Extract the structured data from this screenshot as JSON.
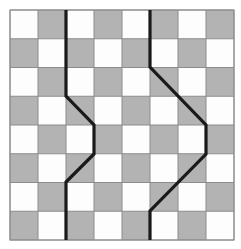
{
  "figure": {
    "colors": {
      "background": "#ffffff",
      "light_cell": "#fdfdfd",
      "dark_cell": "#b3b3b3",
      "cell_border": "#8c8c8c",
      "path_stroke": "#1a1a1a",
      "outer_border": "#8c8c8c"
    }
  },
  "grid": {
    "columns": 8,
    "rows": 8,
    "origin_x": 10,
    "origin_y": 10,
    "cell_width": 28,
    "cell_height": 28.75,
    "border_width": 1,
    "parity_note": "cell is dark when (row + col) is odd, with row 1 col 1 light",
    "cells": [
      [
        "light",
        "dark",
        "light",
        "dark",
        "light",
        "dark",
        "light",
        "dark"
      ],
      [
        "dark",
        "light",
        "dark",
        "light",
        "dark",
        "light",
        "dark",
        "light"
      ],
      [
        "light",
        "dark",
        "light",
        "dark",
        "light",
        "dark",
        "light",
        "dark"
      ],
      [
        "dark",
        "light",
        "dark",
        "light",
        "dark",
        "light",
        "dark",
        "light"
      ],
      [
        "light",
        "dark",
        "light",
        "dark",
        "light",
        "dark",
        "light",
        "dark"
      ],
      [
        "dark",
        "light",
        "dark",
        "light",
        "dark",
        "light",
        "dark",
        "light"
      ],
      [
        "light",
        "dark",
        "light",
        "dark",
        "light",
        "dark",
        "light",
        "dark"
      ],
      [
        "dark",
        "light",
        "dark",
        "light",
        "dark",
        "light",
        "dark",
        "light"
      ]
    ]
  },
  "paths": [
    {
      "name": "left-path",
      "stroke_width": 3.2,
      "points": [
        [
          66,
          10
        ],
        [
          66,
          96
        ],
        [
          94,
          125
        ],
        [
          94,
          154
        ],
        [
          66,
          182
        ],
        [
          66,
          240
        ]
      ]
    },
    {
      "name": "right-path",
      "stroke_width": 3.2,
      "points": [
        [
          150,
          10
        ],
        [
          150,
          67
        ],
        [
          206,
          125
        ],
        [
          206,
          154
        ],
        [
          150,
          211
        ],
        [
          150,
          240
        ]
      ]
    }
  ]
}
